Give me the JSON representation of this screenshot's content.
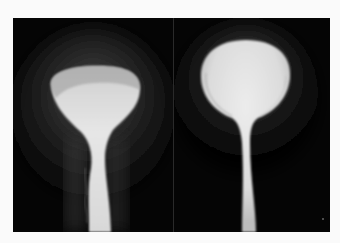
{
  "figure": {
    "panels": [
      {
        "id": "left",
        "description": "radiograph of contrast-filled bladder with flattened dome and irregular lower contour"
      },
      {
        "id": "right",
        "description": "radiograph of contrast-filled bladder with rounded dome and long narrow neck"
      }
    ],
    "colors": {
      "page_background": "#fafafa",
      "film_background": "#050505",
      "contrast_bright": "#e8e8e8",
      "contrast_mid": "#bdbdbd",
      "halo": "#3a3a3a"
    }
  }
}
